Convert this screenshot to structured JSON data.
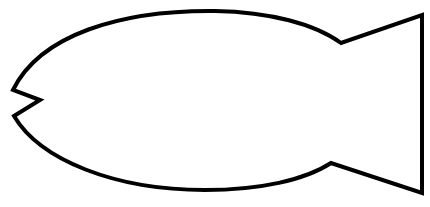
{
  "figure": {
    "stroke_color": "#000000",
    "fill_color": "#ffffff",
    "background": "#ffffff",
    "stroke_width": 4,
    "alt_text": "Simple black outline drawing of a fish with a notched mouth on the left and a triangular tail on the right"
  }
}
